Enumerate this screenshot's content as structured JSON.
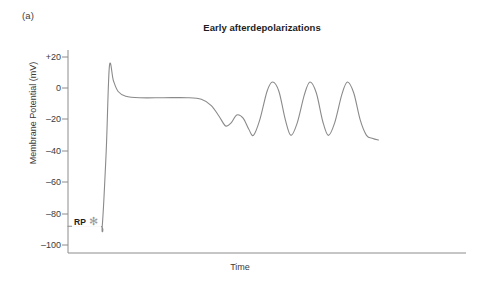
{
  "figure": {
    "panel_label": "(a)",
    "title": "Early afterdepolarizations"
  },
  "axes": {
    "ylabel": "Membrane Potential (mV)",
    "xlabel": "Time",
    "ytick_labels": [
      "+20",
      "0",
      "–20",
      "–40",
      "–60",
      "–80",
      "–100"
    ]
  },
  "annotations": {
    "rp_label": "RP",
    "rp_marker": "star-icon",
    "rp_marker_glyph": "✻"
  },
  "colors": {
    "trace": "#8a8a8a",
    "axis": "#8c8c8c",
    "text": "#3a3a3a",
    "title": "#1d1d1d",
    "marker": "#9a9a9a",
    "background": "#ffffff"
  },
  "chart_data": {
    "type": "line",
    "title": "Early afterdepolarizations",
    "xlabel": "Time",
    "ylabel": "Membrane Potential (mV)",
    "ylim": [
      -100,
      20
    ],
    "xlim": [
      0,
      100
    ],
    "grid": false,
    "legend": null,
    "yticks": [
      20,
      0,
      -20,
      -40,
      -60,
      -80,
      -100
    ],
    "xticks": [],
    "annotations": [
      {
        "text": "RP",
        "value_mv": -88,
        "description": "resting potential marker with star glyph"
      }
    ],
    "series": [
      {
        "name": "Membrane potential",
        "color": "#8a8a8a",
        "description": "Cardiac action potential with four early afterdepolarization oscillations on the plateau",
        "points_mv": [
          {
            "x": 0.0,
            "y": -88
          },
          {
            "x": 8.0,
            "y": -88
          },
          {
            "x": 8.6,
            "y": -88
          },
          {
            "x": 9.6,
            "y": -40
          },
          {
            "x": 10.4,
            "y": 14
          },
          {
            "x": 11.4,
            "y": 5
          },
          {
            "x": 12.6,
            "y": -2
          },
          {
            "x": 14.5,
            "y": -5
          },
          {
            "x": 18.0,
            "y": -6
          },
          {
            "x": 24.0,
            "y": -6
          },
          {
            "x": 30.0,
            "y": -6
          },
          {
            "x": 33.5,
            "y": -7
          },
          {
            "x": 36.0,
            "y": -11
          },
          {
            "x": 38.0,
            "y": -18
          },
          {
            "x": 39.6,
            "y": -24
          },
          {
            "x": 41.0,
            "y": -22
          },
          {
            "x": 42.4,
            "y": -17
          },
          {
            "x": 44.0,
            "y": -19
          },
          {
            "x": 45.4,
            "y": -26
          },
          {
            "x": 46.6,
            "y": -30
          },
          {
            "x": 48.2,
            "y": -20
          },
          {
            "x": 50.0,
            "y": -2
          },
          {
            "x": 51.4,
            "y": 4
          },
          {
            "x": 53.0,
            "y": -2
          },
          {
            "x": 54.6,
            "y": -20
          },
          {
            "x": 56.0,
            "y": -30
          },
          {
            "x": 57.6,
            "y": -22
          },
          {
            "x": 59.4,
            "y": -4
          },
          {
            "x": 60.8,
            "y": 4
          },
          {
            "x": 62.4,
            "y": -3
          },
          {
            "x": 64.0,
            "y": -21
          },
          {
            "x": 65.4,
            "y": -30
          },
          {
            "x": 67.0,
            "y": -22
          },
          {
            "x": 68.8,
            "y": -4
          },
          {
            "x": 70.2,
            "y": 4
          },
          {
            "x": 71.8,
            "y": -3
          },
          {
            "x": 73.4,
            "y": -20
          },
          {
            "x": 75.0,
            "y": -30
          },
          {
            "x": 76.6,
            "y": -32
          },
          {
            "x": 78.0,
            "y": -33
          }
        ]
      }
    ]
  }
}
